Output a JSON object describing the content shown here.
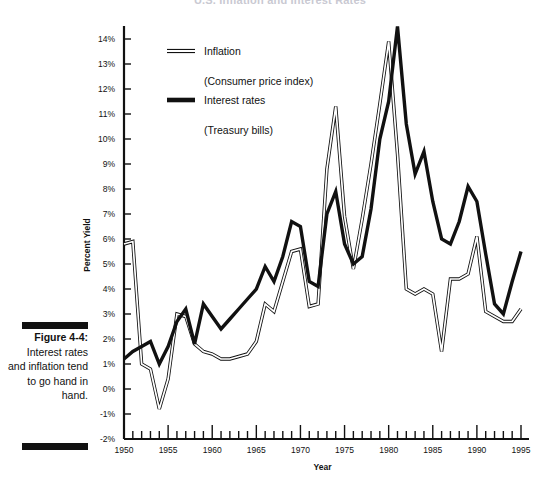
{
  "title": "U.S. Inflation and Interest Rates",
  "caption": {
    "label": "Figure 4-4:",
    "text": "Interest rates and inflation tend to go hand in hand."
  },
  "legend": [
    {
      "name": "inflation",
      "label": "Inflation",
      "sublabel": "(Consumer price index)",
      "style": "outline",
      "color": "#111111"
    },
    {
      "name": "interest",
      "label": "Interest rates",
      "sublabel": "(Treasury bills)",
      "style": "solid",
      "color": "#111111"
    }
  ],
  "chart_data": {
    "type": "line",
    "title": "U.S. Inflation and Interest Rates",
    "xlabel": "Year",
    "ylabel": "Percent Yield",
    "xlim": [
      1950,
      1995
    ],
    "ylim": [
      -2,
      14
    ],
    "grid": false,
    "legend_position": "upper-left-inside",
    "x_tick_labels": [
      "1950",
      "1955",
      "1960",
      "1965",
      "1970",
      "1975",
      "1980",
      "1985",
      "1990",
      "1995"
    ],
    "x_tick_step_major": 5,
    "x_tick_step_minor": 1,
    "y_tick_labels": [
      "-2%",
      "-1%",
      "0%",
      "1%",
      "2%",
      "3%",
      "4%",
      "5%",
      "6%",
      "7%",
      "8%",
      "9%",
      "10%",
      "11%",
      "12%",
      "13%",
      "14%"
    ],
    "y_tick_step": 1,
    "x": [
      1950,
      1951,
      1952,
      1953,
      1954,
      1955,
      1956,
      1957,
      1958,
      1959,
      1960,
      1961,
      1962,
      1963,
      1964,
      1965,
      1966,
      1967,
      1968,
      1969,
      1970,
      1971,
      1972,
      1973,
      1974,
      1975,
      1976,
      1977,
      1978,
      1979,
      1980,
      1981,
      1982,
      1983,
      1984,
      1985,
      1986,
      1987,
      1988,
      1989,
      1990,
      1991,
      1992,
      1993,
      1994,
      1995
    ],
    "series": [
      {
        "name": "Inflation",
        "sublabel": "(Consumer price index)",
        "style": "outline",
        "color": "#111111",
        "values": [
          5.8,
          5.9,
          1.0,
          0.8,
          -0.8,
          0.4,
          3.0,
          2.9,
          1.8,
          1.5,
          1.4,
          1.2,
          1.2,
          1.3,
          1.4,
          1.9,
          3.4,
          3.1,
          4.3,
          5.5,
          5.6,
          3.3,
          3.4,
          8.8,
          11.3,
          6.9,
          4.8,
          6.8,
          9.0,
          11.4,
          13.9,
          9.4,
          4.0,
          3.8,
          4.0,
          3.8,
          1.5,
          4.4,
          4.4,
          4.6,
          6.1,
          3.1,
          2.9,
          2.7,
          2.7,
          3.2
        ]
      },
      {
        "name": "Interest rates",
        "sublabel": "(Treasury bills)",
        "style": "solid",
        "color": "#111111",
        "values": [
          1.2,
          1.5,
          1.7,
          1.9,
          1.0,
          1.7,
          2.7,
          3.2,
          1.8,
          3.4,
          2.9,
          2.4,
          2.8,
          3.2,
          3.6,
          4.0,
          4.9,
          4.3,
          5.3,
          6.7,
          6.5,
          4.3,
          4.1,
          7.0,
          7.9,
          5.8,
          5.0,
          5.3,
          7.2,
          10.0,
          11.5,
          14.5,
          10.6,
          8.6,
          9.5,
          7.5,
          6.0,
          5.8,
          6.7,
          8.1,
          7.5,
          5.4,
          3.4,
          3.0,
          4.3,
          5.5
        ]
      }
    ]
  }
}
